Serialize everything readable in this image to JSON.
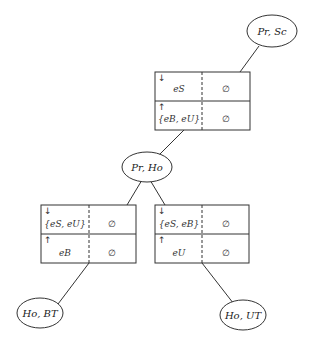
{
  "nodes": {
    "pr_sc": {
      "label": "Pr, Sc"
    },
    "pr_ho": {
      "label": "Pr, Ho"
    },
    "ho_bt": {
      "label": "Ho, BT"
    },
    "ho_ut": {
      "label": "Ho, UT"
    }
  },
  "tables": {
    "top": {
      "down_arrow": "↓",
      "up_arrow": "↑",
      "row1": {
        "left": "eS",
        "right": "∅"
      },
      "row2": {
        "left": "{eB, eU}",
        "right": "∅"
      }
    },
    "left": {
      "down_arrow": "↓",
      "up_arrow": "↑",
      "row1": {
        "left": "{eS, eU}",
        "right": "∅"
      },
      "row2": {
        "left": "eB",
        "right": "∅"
      }
    },
    "right": {
      "down_arrow": "↓",
      "up_arrow": "↑",
      "row1": {
        "left": "{eS, eB}",
        "right": "∅"
      },
      "row2": {
        "left": "eU",
        "right": "∅"
      }
    }
  },
  "edges": [
    {
      "from": "pr_sc",
      "to": "top"
    },
    {
      "from": "top",
      "to": "pr_ho"
    },
    {
      "from": "pr_ho",
      "to": "left"
    },
    {
      "from": "pr_ho",
      "to": "right"
    },
    {
      "from": "left",
      "to": "ho_bt"
    },
    {
      "from": "right",
      "to": "ho_ut"
    }
  ]
}
